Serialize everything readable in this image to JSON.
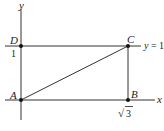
{
  "diagram": {
    "type": "coordinate-geometry",
    "axes": {
      "x_label": "x",
      "y_label": "y"
    },
    "points": [
      {
        "name": "A",
        "coords": [
          0,
          0
        ]
      },
      {
        "name": "B",
        "coords": [
          "√3",
          0
        ]
      },
      {
        "name": "C",
        "coords": [
          "√3",
          1
        ]
      },
      {
        "name": "D",
        "coords": [
          0,
          1
        ]
      }
    ],
    "tick_labels": {
      "y_tick": "1",
      "x_tick_radicand": "3",
      "x_tick_symbol": "√"
    },
    "line_label": {
      "lhs": "y",
      "eq": "=",
      "rhs": "1"
    },
    "segments": [
      "AB",
      "BC",
      "CD",
      "DA",
      "AC"
    ]
  }
}
